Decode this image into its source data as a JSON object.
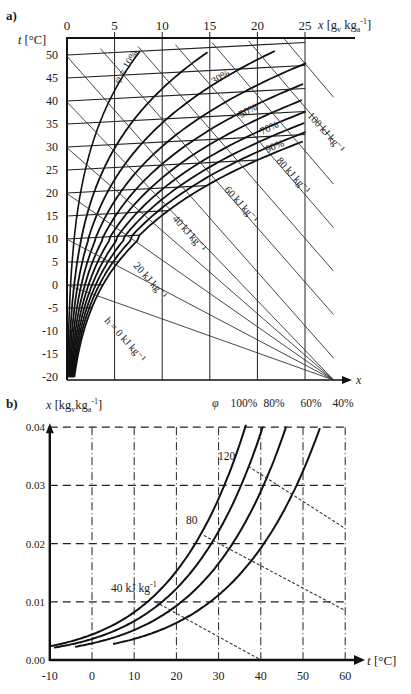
{
  "chart_data": [
    {
      "panel": "a)",
      "type": "line",
      "title": "Mollier h-x diagram for humid air",
      "xlabel": "x [gv kga-1]",
      "ylabel": "t [°C]",
      "x_ticks": [
        0,
        5,
        10,
        15,
        20,
        25
      ],
      "y_ticks": [
        50,
        45,
        40,
        35,
        30,
        25,
        20,
        15,
        10,
        5,
        0,
        -5,
        -10,
        -15,
        -20
      ],
      "xlim": [
        0,
        25
      ],
      "ylim": [
        -20,
        52
      ],
      "bottom_axis_label": "x",
      "grid": true,
      "relative_humidity_curves": [
        "10%",
        "20%",
        "30%",
        "40%",
        "50%",
        "60%",
        "70%",
        "80%",
        "90%",
        "100%"
      ],
      "rh_labels_shown": [
        "φ = 10%",
        "30%",
        "50%",
        "70%",
        "90%"
      ],
      "enthalpy_lines_kJ_per_kg": [
        0,
        10,
        20,
        30,
        40,
        50,
        60,
        70,
        80,
        90,
        100,
        110
      ],
      "enthalpy_labels_shown": [
        "h = 0 kJ kg-1",
        "20 kJ kg-1",
        "40 kJ kg-1",
        "60 kJ kg-1",
        "80 kJ kg-1",
        "100 kJ kg-1"
      ]
    },
    {
      "panel": "b)",
      "type": "line",
      "xlabel": "t [°C]",
      "ylabel": "x [kgv kga-1]",
      "x_ticks": [
        -10,
        0,
        10,
        20,
        30,
        40,
        50,
        60
      ],
      "y_ticks": [
        0.0,
        0.01,
        0.02,
        0.03,
        0.04
      ],
      "xlim": [
        -10,
        60
      ],
      "ylim": [
        0,
        0.04
      ],
      "grid": true,
      "legend_title": "φ",
      "series": [
        {
          "name": "100%",
          "x": [
            -10,
            0,
            10,
            20,
            30,
            35,
            40
          ],
          "y": [
            0.0016,
            0.0038,
            0.0077,
            0.0148,
            0.0272,
            0.0365,
            0.0405
          ]
        },
        {
          "name": "80%",
          "x": [
            -9,
            0,
            10,
            20,
            30,
            40,
            43
          ],
          "y": [
            0.0013,
            0.003,
            0.0061,
            0.0117,
            0.0215,
            0.038,
            0.0405
          ]
        },
        {
          "name": "60%",
          "x": [
            -9,
            0,
            10,
            20,
            30,
            40,
            49
          ],
          "y": [
            0.001,
            0.0022,
            0.0046,
            0.0087,
            0.016,
            0.028,
            0.0405
          ]
        },
        {
          "name": "40%",
          "x": [
            -5,
            0,
            10,
            20,
            30,
            40,
            50,
            58
          ],
          "y": [
            0.0007,
            0.0015,
            0.003,
            0.0058,
            0.0106,
            0.0185,
            0.03,
            0.0405
          ]
        }
      ],
      "enthalpy_lines": [
        {
          "label": "40 kJ kg-1",
          "from": [
            15,
            0.01
          ],
          "to": [
            40,
            0.0
          ]
        },
        {
          "label": "80",
          "from": [
            27,
            0.021
          ],
          "to": [
            60,
            0.0085
          ]
        },
        {
          "label": "120",
          "from": [
            37,
            0.0335
          ],
          "to": [
            60,
            0.0225
          ]
        }
      ]
    }
  ],
  "panel_a": {
    "label": "a)",
    "y_axis_title": "t [°C]",
    "x_axis_title": "x [gv kga-1]",
    "x_axis_end_label": "x",
    "rh_label_10": "φ = 10%",
    "rh_label_30": "30%",
    "rh_label_50": "50%",
    "rh_label_70": "70%",
    "rh_label_90": "90%",
    "h_label_0": "h = 0 kJ kg⁻¹",
    "h_label_20": "20 kJ kg⁻¹",
    "h_label_40": "40 kJ kg⁻¹",
    "h_label_60": "60 kJ kg⁻¹",
    "h_label_80": "80 kJ kg⁻¹",
    "h_label_100": "100 kJ kg⁻¹"
  },
  "panel_b": {
    "label": "b)",
    "y_axis_title": "x [kgvkga-1]",
    "x_axis_title": "t [°C]",
    "phi": "φ",
    "rh": [
      "100%",
      "80%",
      "60%",
      "40%"
    ],
    "h40": "40 kJ kg-1",
    "h80": "80",
    "h120": "120"
  }
}
